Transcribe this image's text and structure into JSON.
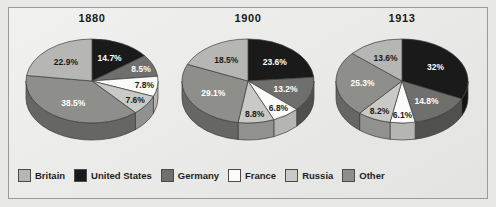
{
  "figure": {
    "background_color": "#e8e8e6",
    "frame_color": "#9a9a98"
  },
  "legend": {
    "position": "bottom",
    "items": [
      {
        "label": "Britain",
        "color": "#b6b6b4"
      },
      {
        "label": "United States",
        "color": "#1a1a1a"
      },
      {
        "label": "Germany",
        "color": "#6f6f6d"
      },
      {
        "label": "France",
        "color": "#fbfbf9"
      },
      {
        "label": "Russia",
        "color": "#c9c9c6"
      },
      {
        "label": "Other",
        "color": "#8e8e8b"
      }
    ]
  },
  "chart_data": [
    {
      "type": "pie",
      "title": "1880",
      "categories": [
        "United States",
        "Germany",
        "France",
        "Russia",
        "Other",
        "Britain"
      ],
      "values": [
        14.7,
        8.5,
        7.8,
        7.6,
        38.5,
        22.9
      ],
      "labels": [
        "14.7%",
        "8.5%",
        "7.8%",
        "7.6%",
        "38.5%",
        "22.9%"
      ],
      "colors": [
        "#1a1a1a",
        "#6f6f6d",
        "#fbfbf9",
        "#c9c9c6",
        "#8e8e8b",
        "#b6b6b4"
      ],
      "label_colors": [
        "#ffffff",
        "#ffffff",
        "#1a1a1a",
        "#1a1a1a",
        "#ffffff",
        "#1a1a1a"
      ]
    },
    {
      "type": "pie",
      "title": "1900",
      "categories": [
        "United States",
        "Germany",
        "France",
        "Russia",
        "Other",
        "Britain"
      ],
      "values": [
        23.6,
        13.2,
        6.8,
        8.8,
        29.1,
        18.5
      ],
      "labels": [
        "23.6%",
        "13.2%",
        "6.8%",
        "8.8%",
        "29.1%",
        "18.5%"
      ],
      "colors": [
        "#1a1a1a",
        "#6f6f6d",
        "#fbfbf9",
        "#c9c9c6",
        "#8e8e8b",
        "#b6b6b4"
      ],
      "label_colors": [
        "#ffffff",
        "#ffffff",
        "#1a1a1a",
        "#1a1a1a",
        "#ffffff",
        "#1a1a1a"
      ]
    },
    {
      "type": "pie",
      "title": "1913",
      "categories": [
        "United States",
        "Germany",
        "France",
        "Russia",
        "Other",
        "Britain"
      ],
      "values": [
        32,
        14.8,
        6.1,
        8.2,
        25.3,
        13.6
      ],
      "labels": [
        "32%",
        "14.8%",
        "6.1%",
        "8.2%",
        "25.3%",
        "13.6%"
      ],
      "colors": [
        "#1a1a1a",
        "#6f6f6d",
        "#fbfbf9",
        "#c9c9c6",
        "#8e8e8b",
        "#b6b6b4"
      ],
      "label_colors": [
        "#ffffff",
        "#ffffff",
        "#1a1a1a",
        "#1a1a1a",
        "#ffffff",
        "#1a1a1a"
      ]
    }
  ]
}
